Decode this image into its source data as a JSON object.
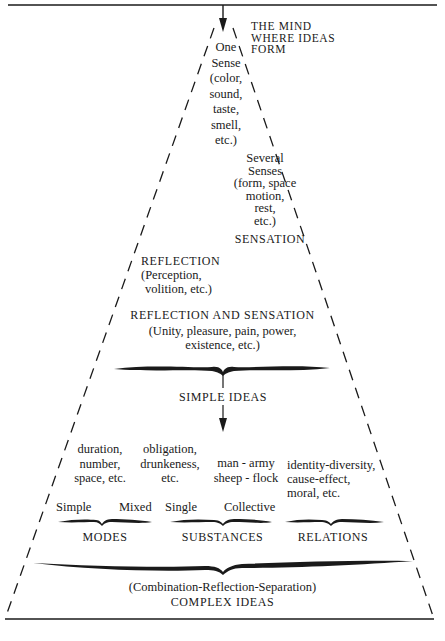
{
  "diagram": {
    "source_label": [
      "THE MIND",
      "WHERE IDEAS",
      "FORM"
    ],
    "one_sense": {
      "title": [
        "One",
        "Sense"
      ],
      "examples": [
        "(color,",
        "sound,",
        "taste,",
        "smell,",
        "etc.)"
      ]
    },
    "several_senses": {
      "title": [
        "Several",
        "Senses"
      ],
      "examples": [
        "(form, space",
        "motion,",
        "rest,",
        "etc.)"
      ]
    },
    "sensation_label": "SENSATION",
    "reflection": {
      "title": "REFLECTION",
      "examples": [
        "(Perception,",
        "volition, etc.)"
      ]
    },
    "reflection_and_sensation": {
      "title": "REFLECTION AND SENSATION",
      "examples": [
        "(Unity, pleasure, pain, power,",
        "existence, etc.)"
      ]
    },
    "simple_ideas_label": "SIMPLE IDEAS",
    "modes": {
      "simple_examples": [
        "duration,",
        "number,",
        "space, etc."
      ],
      "mixed_examples": [
        "obligation,",
        "drunkeness,",
        "etc."
      ],
      "simple_label": "Simple",
      "mixed_label": "Mixed",
      "title": "MODES"
    },
    "substances": {
      "examples": [
        "man - army",
        "sheep - flock"
      ],
      "single_label": "Single",
      "collective_label": "Collective",
      "title": "SUBSTANCES"
    },
    "relations": {
      "examples": [
        "identity-diversity,",
        "cause-effect,",
        "moral, etc."
      ],
      "title": "RELATIONS"
    },
    "complex_ideas": {
      "process": "(Combination-Reflection-Separation)",
      "title": "COMPLEX IDEAS"
    }
  },
  "colors": {
    "ink": "#1a1a1a",
    "background": "#ffffff"
  }
}
